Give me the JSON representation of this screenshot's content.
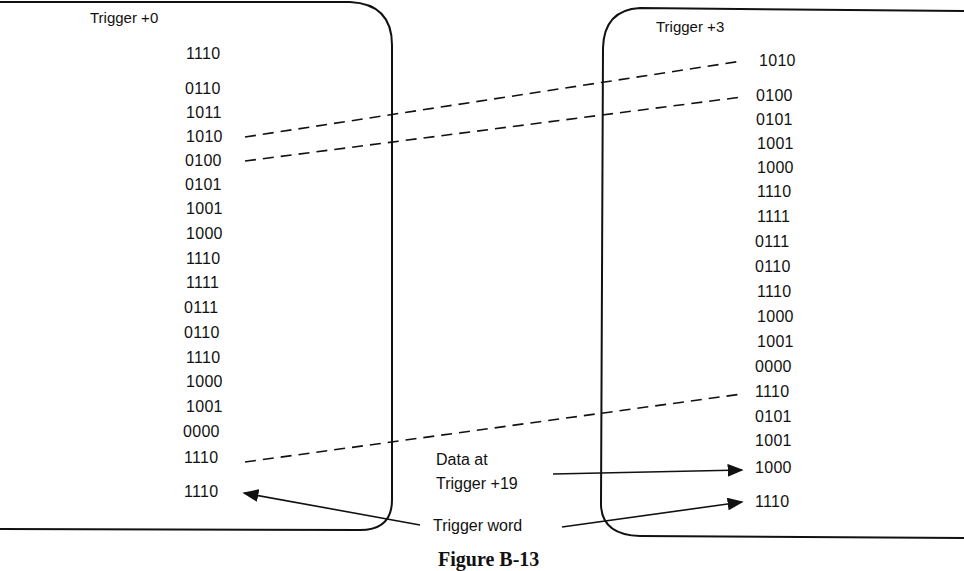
{
  "left_panel": {
    "title": "Trigger +0",
    "words": [
      "1110",
      "0110",
      "1011",
      "1010",
      "0100",
      "0101",
      "1001",
      "1000",
      "1110",
      "1111",
      "0111",
      "0110",
      "1110",
      "1000",
      "1001",
      "0000",
      "1110",
      "1110"
    ]
  },
  "right_panel": {
    "title": "Trigger +3",
    "words": [
      "1010",
      "0100",
      "0101",
      "1001",
      "1000",
      "1110",
      "1111",
      "0111",
      "0110",
      "1110",
      "1000",
      "1001",
      "0000",
      "1110",
      "0101",
      "1001",
      "1000",
      "1110"
    ]
  },
  "annotations": {
    "data_at_line1": "Data at",
    "data_at_line2": "Trigger +19",
    "trigger_word": "Trigger word"
  },
  "caption": "Figure B-13",
  "colors": {
    "ink": "#111111",
    "paper": "#ffffff"
  }
}
